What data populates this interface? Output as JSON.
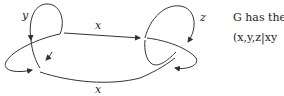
{
  "diagram": {
    "labels": {
      "y": "y",
      "x_top": "x",
      "x_bottom": "x",
      "z": "z"
    },
    "stroke_color": "#333333"
  },
  "text": {
    "line1": "G has the",
    "line2": "(x,y,z|xy"
  }
}
